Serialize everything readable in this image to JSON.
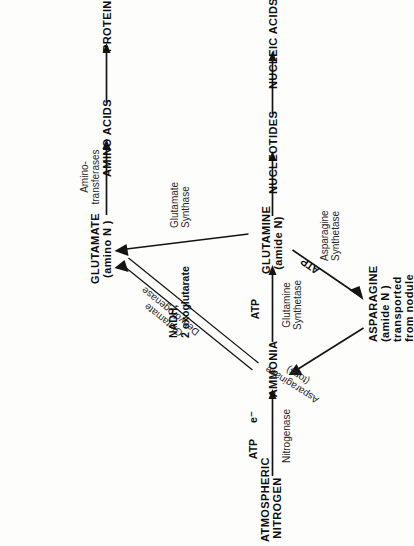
{
  "diagram": {
    "orientation": "rotated-90-ccw",
    "background_color": "#fdfdfc",
    "ink_color": "#141414",
    "nodes": [
      {
        "id": "atmospheric-nitrogen",
        "label": "ATMOSPHERIC\nNITROGEN"
      },
      {
        "id": "ammonia",
        "label": "AMMONIA"
      },
      {
        "id": "glutamine",
        "label": "GLUTAMINE\n(amide N)"
      },
      {
        "id": "glutamate",
        "label": "GLUTAMATE\n(amino N )"
      },
      {
        "id": "amino-acids",
        "label": "AMINO ACIDS"
      },
      {
        "id": "proteins",
        "label": "PROTEINS"
      },
      {
        "id": "nucleotides",
        "label": "NUCLEOTIDES"
      },
      {
        "id": "nucleic-acids",
        "label": "NUCLEIC ACIDS"
      },
      {
        "id": "asparagine",
        "label": "ASPARAGINE\n(amide N )\ntransported\nfrom nodule"
      }
    ],
    "enzymes": [
      {
        "id": "nitrogenase",
        "label": "Nitrogenase"
      },
      {
        "id": "glutamine-synthetase",
        "label": "Glutamine\nSynthetase"
      },
      {
        "id": "glutamate-dehydrogenase",
        "label": "Glutamate\nDehydrogenase"
      },
      {
        "id": "glutamate-synthase",
        "label": "Glutamate\nSynthase"
      },
      {
        "id": "asparagine-synthetase",
        "label": "Asparagine\nSynthetase"
      },
      {
        "id": "asparaginase",
        "label": "Asparaginase\n(tops)"
      },
      {
        "id": "amino-transferases",
        "label": "Amino-\ntransferases"
      }
    ],
    "cofactors": [
      {
        "id": "atp-nitrogenase",
        "label": "ATP"
      },
      {
        "id": "electrons",
        "label": "e⁻"
      },
      {
        "id": "atp-glutamine-synthetase",
        "label": "ATP"
      },
      {
        "id": "atp-asparagine-synthetase",
        "label": "ATP"
      },
      {
        "id": "nadh-oxoglutarate",
        "label": "NADH,\n2 oxoglutarate"
      }
    ],
    "edges": [
      {
        "from": "atmospheric-nitrogen",
        "to": "ammonia",
        "enzyme": "nitrogenase",
        "cofactors": "ATP, e⁻"
      },
      {
        "from": "ammonia",
        "to": "glutamine",
        "enzyme": "glutamine-synthetase",
        "cofactors": "ATP"
      },
      {
        "from": "ammonia",
        "to": "glutamate",
        "enzyme": "glutamate-dehydrogenase",
        "style": "double-line"
      },
      {
        "from": "glutamine",
        "to": "glutamate",
        "enzyme": "glutamate-synthase",
        "cofactors": "NADH, 2 oxoglutarate"
      },
      {
        "from": "glutamine",
        "to": "asparagine",
        "enzyme": "asparagine-synthetase",
        "cofactors": "ATP"
      },
      {
        "from": "asparagine",
        "to": "ammonia",
        "enzyme": "asparaginase"
      },
      {
        "from": "glutamate",
        "to": "amino-acids",
        "enzyme": "amino-transferases"
      },
      {
        "from": "amino-acids",
        "to": "proteins"
      },
      {
        "from": "glutamine",
        "to": "nucleotides"
      },
      {
        "from": "nucleotides",
        "to": "nucleic-acids"
      }
    ]
  }
}
